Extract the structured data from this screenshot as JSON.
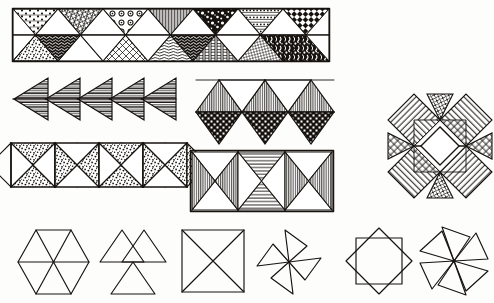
{
  "figure": {
    "medium": "pen and ink line drawing on paper",
    "ink_color": "#16130f",
    "paper_color": "#fdfdfb",
    "width": 494,
    "height": 303,
    "caption": ""
  },
  "groups": [
    {
      "id": "top-band",
      "name": "zigzag-triangle-band",
      "description": "Long horizontal rectangular band filled with alternating up and down triangles, each filled with a different hand-drawn texture",
      "x": 12,
      "y": 8,
      "width": 318,
      "height": 54,
      "columns": 7,
      "rows": 2,
      "cell_fills_top": [
        "dots-rows",
        "dense-crosshatch",
        "circles",
        "vertical-lines",
        "blotch-dark",
        "dotted-rows",
        "checker-dots"
      ],
      "cell_fills_bottom": [
        "stipple-dark",
        "scribble-dark",
        "net-diamond",
        "wavy-bands",
        "ladder-bars",
        "crosshatch-fine",
        "mottled-dark"
      ]
    },
    {
      "id": "mid-left-arrows",
      "name": "chevron-arrow-row",
      "description": "Five left-pointing chevrons, each formed by two horizontally striped triangles meeting at a point",
      "x": 14,
      "y": 76,
      "width": 160,
      "height": 48,
      "count": 5,
      "fill": "horizontal-stripes",
      "direction": "left"
    },
    {
      "id": "mid-center-band",
      "name": "triangle-strip-vertical-and-check",
      "description": "Strip of interlocking triangles; upward triangles filled with vertical lines, downward triangles filled with dense checkerboard",
      "x": 196,
      "y": 78,
      "width": 146,
      "height": 60,
      "up_fill": "vertical-lines",
      "down_fill": "checkerboard-dense",
      "up_count": 3,
      "down_count": 3
    },
    {
      "id": "right-star",
      "name": "eight-point-star-block",
      "description": "Eight pointed star quilt block built from diagonal hatched diamonds and triangles around an open centre square",
      "x": 388,
      "y": 92,
      "width": 104,
      "height": 108,
      "points": 8,
      "center": "open-white-square",
      "fills": [
        "diagonal-hatch-left",
        "crosshatch",
        "diagonal-hatch-right",
        "grid-hatch"
      ]
    },
    {
      "id": "row3-left-squares",
      "name": "stippled-hourglass-square-band",
      "description": "Band of four squares each split by both diagonals into four triangles; opposing pairs stippled dark, with plain diamonds linking the squares",
      "x": 10,
      "y": 140,
      "width": 168,
      "height": 66,
      "square_count": 4,
      "fill": "stipple",
      "link_shape": "diamond"
    },
    {
      "id": "row3-center-rect",
      "name": "hatched-hourglass-rectangle",
      "description": "Rectangle divided into three squares, each split by both diagonals; triangles carry line hatching running in alternating directions",
      "x": 190,
      "y": 150,
      "width": 142,
      "height": 58,
      "square_count": 3,
      "fills": [
        "vertical-lines",
        "horizontal-lines",
        "vertical-lines"
      ]
    },
    {
      "id": "bottom-hexagon",
      "name": "hexagon-six-triangles",
      "description": "Plain outline hexagon divided into six equilateral triangles meeting at the centre",
      "x": 16,
      "y": 228,
      "width": 74,
      "height": 68,
      "segments": 6
    },
    {
      "id": "bottom-tri-cluster",
      "name": "three-triangle-cluster",
      "description": "Three plain outline triangles arranged around a common centre point",
      "x": 96,
      "y": 228,
      "width": 74,
      "height": 68,
      "segments": 3
    },
    {
      "id": "bottom-square-x",
      "name": "square-with-diagonals",
      "description": "Plain outline square crossed by both diagonals forming four triangles",
      "x": 182,
      "y": 228,
      "width": 62,
      "height": 62
    },
    {
      "id": "bottom-pinwheel-4",
      "name": "four-blade-pinwheel",
      "description": "Pinwheel of four narrow triangular blades radiating from a centre point",
      "x": 256,
      "y": 228,
      "width": 62,
      "height": 62,
      "blades": 4
    },
    {
      "id": "bottom-square-in-diamond",
      "name": "square-inscribed-in-diamond",
      "description": "Upright square set inside a rotated square (diamond), corners touching the midpoints",
      "x": 344,
      "y": 228,
      "width": 70,
      "height": 66
    },
    {
      "id": "bottom-pinwheel-6",
      "name": "six-blade-pinwheel",
      "description": "Pinwheel of six triangular blades radiating from a centre point",
      "x": 418,
      "y": 226,
      "width": 72,
      "height": 70,
      "blades": 6
    }
  ]
}
